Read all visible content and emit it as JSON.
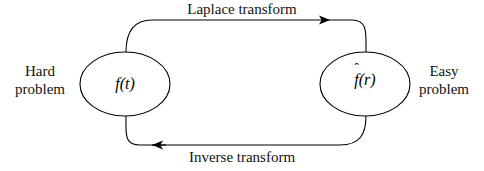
{
  "figure": {
    "type": "transform-block-diagram",
    "background_color": "#ffffff",
    "stroke_color": "#000000"
  },
  "nodes": [
    {
      "id": "time-domain",
      "label": "f(t)",
      "label_base": "f",
      "label_args": "(t)",
      "has_hat": false,
      "cx": 125,
      "cy": 84,
      "rx": 45,
      "ry": 32
    },
    {
      "id": "transform-domain",
      "label": "f̂(r)",
      "label_base": "f",
      "label_args": "(r)",
      "has_hat": true,
      "hat": "ˆ",
      "cx": 365,
      "cy": 84,
      "rx": 45,
      "ry": 32
    }
  ],
  "edges": [
    {
      "id": "forward",
      "label": "Laplace transform",
      "direction": "left-to-right",
      "arrow_tip_x": 330,
      "arrow_tip_y": 20
    },
    {
      "id": "inverse",
      "label": "Inverse transform",
      "direction": "right-to-left",
      "arrow_tip_x": 152,
      "arrow_tip_y": 145
    }
  ],
  "annotations": {
    "left": {
      "line1": "Hard",
      "line2": "problem"
    },
    "right": {
      "line1": "Easy",
      "line2": "problem"
    }
  }
}
